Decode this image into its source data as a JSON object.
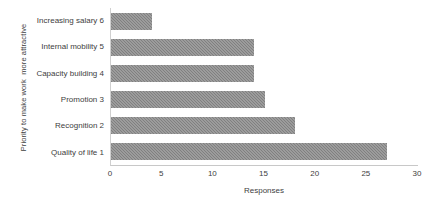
{
  "chart_data": {
    "type": "bar",
    "orientation": "horizontal",
    "title": "",
    "xlabel": "Responses",
    "ylabel": "Priority to make work  more attractive",
    "categories": [
      "Increasing salary 6",
      "Internal mobility 5",
      "Capacity building 4",
      "Promotion 3",
      "Recognition 2",
      "Quality of life 1"
    ],
    "values": [
      4,
      14,
      14,
      15,
      18,
      27
    ],
    "xlim": [
      0,
      30
    ],
    "xticks": [
      0,
      5,
      10,
      15,
      20,
      25,
      30
    ],
    "xtick_labels": [
      "0",
      "5",
      "10",
      "15",
      "20",
      "25",
      "30"
    ],
    "grid": false,
    "legend": false,
    "bar_color": "#808080",
    "bar_pattern": "checker-texture",
    "axis_color": "#c8c8c8",
    "text_color": "#404040"
  }
}
